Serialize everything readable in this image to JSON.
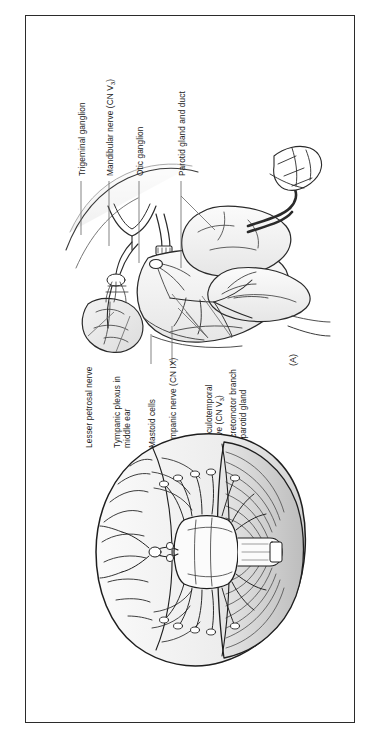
{
  "figure": {
    "panel_letter": "(A)",
    "background_color": "#ffffff",
    "border_color": "#2b2b2b",
    "ink_color": "#1a1a1a",
    "leader_color": "#6e6e6e"
  },
  "labels": {
    "trigeminal_ganglion": "Trigeminal ganglion",
    "mandibular_nerve": "Mandibular nerve (CN V",
    "mandibular_nerve_sub": "3",
    "mandibular_nerve_tail": ")",
    "otic_ganglion": "Otic ganglion",
    "parotid_gland_and_duct": "Parotid gland and duct",
    "lesser_petrosal_nerve": "Lesser petrosal nerve",
    "tympanic_plexus_line1": "Tympanic plexus in",
    "tympanic_plexus_line2": "middle ear",
    "mastoid_cells": "Mastoid cells",
    "tympanic_nerve": "Tympanic nerve (CN IX)",
    "auriculotemporal_line1": "Auriculotemporal",
    "auriculotemporal_line2": "nerve (CN V",
    "auriculotemporal_sub": "3",
    "auriculotemporal_tail": ")",
    "secretomotor_line1": "Secretomotor branch",
    "secretomotor_line2": "to parotid gland"
  },
  "illustrations": {
    "top_drawing_name": "parotid-gland-innervation-drawing",
    "bottom_drawing_name": "brain-inferior-view-drawing"
  }
}
